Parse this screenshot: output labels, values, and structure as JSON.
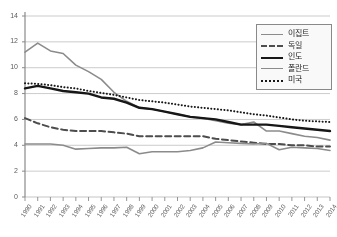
{
  "chart_data": {
    "type": "line",
    "title": "",
    "xlabel": "",
    "ylabel": "",
    "ylim": [
      0,
      14
    ],
    "yticks": [
      0,
      2,
      4,
      6,
      8,
      10,
      12,
      14
    ],
    "grid": true,
    "legend_position": "top-right",
    "x": [
      1990,
      1991,
      1992,
      1993,
      1994,
      1995,
      1996,
      1997,
      1998,
      1999,
      2000,
      2001,
      2002,
      2003,
      2004,
      2005,
      2006,
      2007,
      2008,
      2009,
      2010,
      2011,
      2012,
      2013,
      2014
    ],
    "categories": [
      "1990",
      "1991",
      "1992",
      "1993",
      "1994",
      "1995",
      "1996",
      "1997",
      "1998",
      "1999",
      "2000",
      "2001",
      "2002",
      "2003",
      "2004",
      "2005",
      "2006",
      "2007",
      "2008",
      "2009",
      "2010",
      "2011",
      "2012",
      "2013",
      "2014"
    ],
    "series": [
      {
        "name": "이집트",
        "style": "solid",
        "color": "#8c8c8c",
        "width": 1.6,
        "values": [
          11.2,
          11.9,
          11.3,
          11.1,
          10.2,
          9.7,
          9.1,
          8.1,
          7.4,
          6.9,
          6.8,
          6.6,
          6.4,
          6.2,
          6.1,
          5.9,
          5.7,
          5.6,
          5.8,
          5.1,
          5.1,
          4.9,
          4.7,
          4.6,
          4.4
        ]
      },
      {
        "name": "독일",
        "style": "dashed",
        "color": "#4a4a4a",
        "width": 2.0,
        "values": [
          6.1,
          5.7,
          5.4,
          5.2,
          5.1,
          5.1,
          5.1,
          5.0,
          4.9,
          4.7,
          4.7,
          4.7,
          4.7,
          4.7,
          4.7,
          4.5,
          4.4,
          4.3,
          4.2,
          4.1,
          4.1,
          4.0,
          4.0,
          3.9,
          3.9
        ]
      },
      {
        "name": "인도",
        "style": "solid",
        "color": "#111111",
        "width": 2.4,
        "values": [
          8.4,
          8.6,
          8.4,
          8.2,
          8.1,
          8.0,
          7.7,
          7.6,
          7.3,
          6.9,
          6.8,
          6.6,
          6.4,
          6.2,
          6.1,
          6.0,
          5.8,
          5.6,
          5.6,
          5.6,
          5.5,
          5.4,
          5.3,
          5.2,
          5.1
        ]
      },
      {
        "name": "폴란드",
        "style": "solid",
        "color": "#8c8c8c",
        "width": 1.6,
        "values": [
          4.1,
          4.1,
          4.1,
          4.0,
          3.7,
          3.75,
          3.8,
          3.8,
          3.85,
          3.35,
          3.5,
          3.5,
          3.5,
          3.6,
          3.8,
          4.25,
          4.2,
          4.15,
          4.1,
          4.15,
          3.65,
          3.85,
          3.8,
          3.75,
          3.6
        ]
      },
      {
        "name": "미국",
        "style": "dotted",
        "color": "#111111",
        "width": 2.0,
        "values": [
          8.8,
          8.75,
          8.65,
          8.5,
          8.4,
          8.2,
          8.05,
          7.9,
          7.7,
          7.5,
          7.4,
          7.3,
          7.15,
          7.0,
          6.9,
          6.8,
          6.7,
          6.55,
          6.4,
          6.3,
          6.15,
          6.0,
          5.9,
          5.85,
          5.8
        ]
      }
    ]
  }
}
